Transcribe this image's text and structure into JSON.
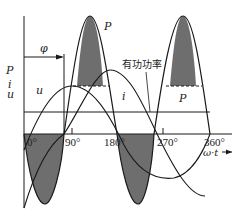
{
  "diagram": {
    "title": "",
    "axis_labels": {
      "vertical_p": "P",
      "vertical_i": "i",
      "vertical_u": "u",
      "horizontal": "ω·t"
    },
    "angle_ticks": [
      "0°",
      "90°",
      "180°",
      "270°",
      "360°"
    ],
    "phase_label": "φ",
    "curve_labels": {
      "voltage": "u",
      "current": "i",
      "power_top_1": "P",
      "power_top_2": "P",
      "active_power": "有功功率"
    },
    "colors": {
      "line": "#1a1a1a",
      "fill": "#6e6e6e",
      "background": "#ffffff"
    }
  }
}
